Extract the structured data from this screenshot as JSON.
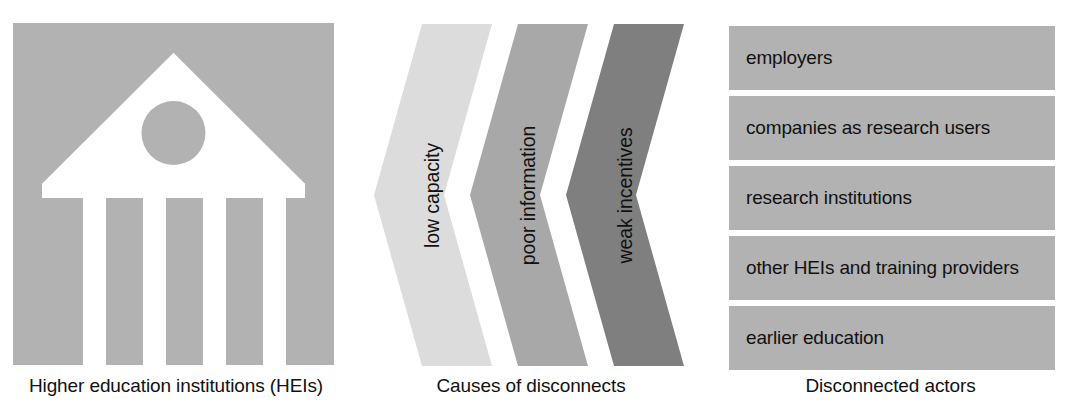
{
  "figure": {
    "background_color": "#ffffff",
    "text_color": "#111111"
  },
  "panels": [
    {
      "id": "hei",
      "caption": "Higher education institutions (HEIs)",
      "icon_name": "university-building-icon",
      "tile_color": "#b2b2b2",
      "icon_color": "#ffffff"
    },
    {
      "id": "causes",
      "caption": "Causes of disconnects",
      "items": [
        {
          "label": "low capacity",
          "color": "#dcdcdc"
        },
        {
          "label": "poor information",
          "color": "#a8a8a8"
        },
        {
          "label": "weak incentives",
          "color": "#7f7f7f"
        }
      ]
    },
    {
      "id": "actors",
      "caption": "Disconnected actors",
      "bar_color": "#b2b2b2",
      "items": [
        {
          "label": "employers"
        },
        {
          "label": "companies as research users"
        },
        {
          "label": "research institutions"
        },
        {
          "label": "other HEIs and training providers"
        },
        {
          "label": "earlier education"
        }
      ]
    }
  ]
}
